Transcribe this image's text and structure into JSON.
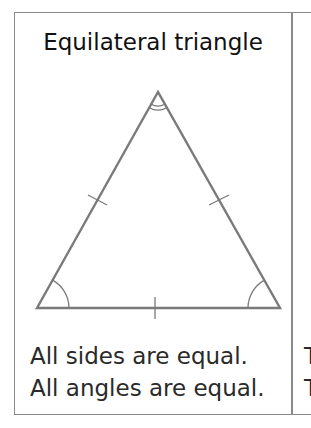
{
  "panel": {
    "title": "Equilateral triangle",
    "captions": [
      "All sides are equal.",
      "All angles are equal."
    ],
    "diagram": {
      "shape": "equilateral-triangle",
      "vertices": {
        "apex": [
          158,
          92
        ],
        "base_left": [
          37,
          308
        ],
        "base_right": [
          280,
          308
        ]
      },
      "side_ticks": 3,
      "angle_marks": {
        "apex": "double-arc",
        "base_left": "single-arc",
        "base_right": "single-arc"
      },
      "stroke_color": "#7a7a7a"
    }
  },
  "next_panel": {
    "partial_lines": [
      "T",
      "T"
    ]
  },
  "colors": {
    "border": "#8a8a8a",
    "title_text": "#111111",
    "body_text": "#2a2a2a",
    "background": "#ffffff"
  }
}
